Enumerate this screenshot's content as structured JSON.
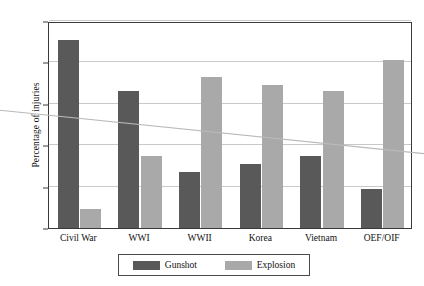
{
  "chart_data": {
    "type": "bar",
    "title": "",
    "subtitle": "",
    "xlabel": "",
    "ylabel": "Percentage of injuries",
    "ylim": [
      0,
      100
    ],
    "yticks": [
      0,
      20,
      40,
      60,
      80,
      100
    ],
    "ytick_labels": [
      "0",
      "20",
      "40",
      "60",
      "80",
      "100"
    ],
    "grid": true,
    "legend_position": "bottom",
    "categories": [
      "Civil War",
      "WWI",
      "WWII",
      "Korea",
      "Vietnam",
      "OEF/OIF"
    ],
    "series": [
      {
        "name": "Gunshot",
        "color": "#595959",
        "values": [
          91,
          66,
          27,
          31,
          35,
          19
        ]
      },
      {
        "name": "Explosion",
        "color": "#a9a9a9",
        "values": [
          9,
          35,
          73,
          69,
          66,
          81
        ]
      }
    ],
    "annotations": [
      {
        "name": "trend-line",
        "description": "faint descending diagonal line",
        "color": "#b9b9b9",
        "start_value": 55,
        "end_value": 37
      }
    ]
  },
  "axis": {
    "y_title": "Percentage of injuries"
  },
  "legend": {
    "entries": [
      {
        "label": "Gunshot",
        "color": "#595959"
      },
      {
        "label": "Explosion",
        "color": "#a9a9a9"
      }
    ]
  }
}
